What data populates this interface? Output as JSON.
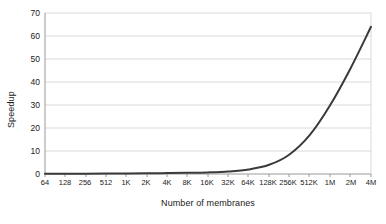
{
  "chart_data": {
    "type": "line",
    "title": "",
    "xlabel": "Number of membranes",
    "ylabel": "Speedup",
    "categories": [
      "64",
      "128",
      "256",
      "512",
      "1K",
      "2K",
      "4K",
      "8K",
      "16K",
      "32K",
      "64K",
      "128K",
      "256K",
      "512K",
      "1M",
      "2M",
      "4M"
    ],
    "values": [
      0.1,
      0.1,
      0.15,
      0.2,
      0.25,
      0.3,
      0.4,
      0.5,
      0.7,
      1.1,
      2.0,
      4.0,
      8.5,
      17.0,
      30.0,
      46.0,
      64.0
    ],
    "series": [
      {
        "name": "Speedup",
        "values": [
          0.1,
          0.1,
          0.15,
          0.2,
          0.25,
          0.3,
          0.4,
          0.5,
          0.7,
          1.1,
          2.0,
          4.0,
          8.5,
          17.0,
          30.0,
          46.0,
          64.0
        ],
        "color": "#3a3a3a"
      }
    ],
    "ylim": [
      0,
      70
    ],
    "yticks": [
      0,
      10,
      20,
      30,
      40,
      50,
      60,
      70
    ],
    "ytick_labels": [
      "0",
      "10",
      "20",
      "30",
      "40",
      "50",
      "60",
      "70"
    ],
    "grid": "horizontal",
    "legend": "none",
    "gridline_color": "#d9d9d9",
    "axis_color": "#9a9a9a",
    "line_color": "#3a3a3a",
    "background": "#ffffff"
  }
}
